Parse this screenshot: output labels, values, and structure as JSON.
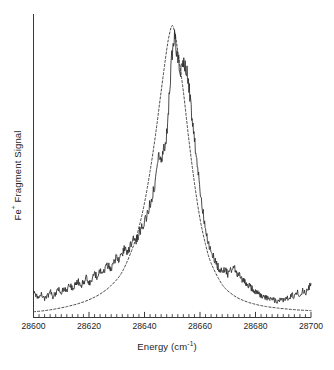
{
  "figure": {
    "name": "fe-fragment-photodissociation-spectrum"
  },
  "axes": {
    "ylabel_pre": "Fe",
    "ylabel_sup": "+",
    "ylabel_post": " Fragment Signal",
    "xlabel_pre": "Energy (cm",
    "xlabel_sup": "-1",
    "xlabel_post": ")"
  },
  "chart_data": {
    "type": "line",
    "title": "",
    "xlabel": "Energy (cm-1)",
    "ylabel": "Fe+ Fragment Signal",
    "xlim": [
      28600,
      28700
    ],
    "ylim": [
      0,
      1.06
    ],
    "grid": false,
    "legend": null,
    "x_major_ticks": [
      28600,
      28620,
      28640,
      28660,
      28680,
      28700
    ],
    "x_tick_labels": [
      "28600",
      "28620",
      "28640",
      "28660",
      "28680",
      "28700"
    ],
    "x_minor_tick_step": 2,
    "y_ticks": [],
    "y_tick_labels": [],
    "series": [
      {
        "name": "experimental spectrum",
        "style": "solid",
        "color": "#2b2b2b",
        "x": [
          28600,
          28601,
          28602,
          28603,
          28604,
          28605,
          28606,
          28607,
          28608,
          28609,
          28610,
          28611,
          28612,
          28613,
          28614,
          28615,
          28616,
          28617,
          28618,
          28619,
          28620,
          28621,
          28622,
          28623,
          28624,
          28625,
          28626,
          28627,
          28628,
          28629,
          28630,
          28631,
          28632,
          28633,
          28634,
          28635,
          28636,
          28637,
          28638,
          28639,
          28640,
          28641,
          28642,
          28643,
          28644,
          28645,
          28646,
          28647,
          28648,
          28649,
          28650,
          28651,
          28652,
          28653,
          28654,
          28655,
          28656,
          28657,
          28658,
          28659,
          28660,
          28661,
          28662,
          28663,
          28664,
          28665,
          28666,
          28667,
          28668,
          28669,
          28670,
          28671,
          28672,
          28673,
          28674,
          28675,
          28676,
          28677,
          28678,
          28679,
          28680,
          28681,
          28682,
          28683,
          28684,
          28685,
          28686,
          28687,
          28688,
          28689,
          28690,
          28691,
          28692,
          28693,
          28694,
          28695,
          28696,
          28697,
          28698,
          28699,
          28700
        ],
        "y": [
          0.088,
          0.079,
          0.071,
          0.083,
          0.061,
          0.074,
          0.092,
          0.07,
          0.086,
          0.099,
          0.082,
          0.104,
          0.093,
          0.118,
          0.101,
          0.113,
          0.128,
          0.108,
          0.124,
          0.137,
          0.119,
          0.133,
          0.152,
          0.141,
          0.163,
          0.15,
          0.172,
          0.186,
          0.17,
          0.196,
          0.213,
          0.199,
          0.226,
          0.243,
          0.228,
          0.258,
          0.279,
          0.266,
          0.295,
          0.318,
          0.333,
          0.362,
          0.397,
          0.43,
          0.476,
          0.56,
          0.542,
          0.585,
          0.64,
          0.78,
          0.93,
          0.985,
          0.9,
          0.862,
          0.905,
          0.87,
          0.81,
          0.7,
          0.62,
          0.54,
          0.455,
          0.372,
          0.3,
          0.258,
          0.235,
          0.206,
          0.186,
          0.168,
          0.158,
          0.17,
          0.152,
          0.163,
          0.178,
          0.16,
          0.148,
          0.136,
          0.124,
          0.116,
          0.108,
          0.098,
          0.092,
          0.084,
          0.078,
          0.074,
          0.07,
          0.066,
          0.062,
          0.06,
          0.058,
          0.064,
          0.06,
          0.072,
          0.066,
          0.082,
          0.07,
          0.088,
          0.076,
          0.096,
          0.082,
          0.1,
          0.118
        ]
      },
      {
        "name": "fitted profile",
        "style": "dashed",
        "color": "#4a4a4a",
        "x": [
          28600,
          28604,
          28608,
          28612,
          28616,
          28620,
          28624,
          28628,
          28632,
          28636,
          28638,
          28640,
          28642,
          28644,
          28646,
          28648,
          28649,
          28650,
          28651,
          28652,
          28654,
          28656,
          28658,
          28660,
          28662,
          28664,
          28668,
          28672,
          28676,
          28680,
          28684,
          28688,
          28692,
          28696,
          28700
        ],
        "y": [
          0.02,
          0.024,
          0.03,
          0.038,
          0.048,
          0.062,
          0.082,
          0.112,
          0.16,
          0.25,
          0.315,
          0.4,
          0.51,
          0.64,
          0.79,
          0.935,
          0.99,
          1.02,
          0.99,
          0.93,
          0.79,
          0.62,
          0.47,
          0.345,
          0.255,
          0.19,
          0.115,
          0.078,
          0.058,
          0.046,
          0.038,
          0.033,
          0.029,
          0.026,
          0.024
        ]
      }
    ]
  }
}
